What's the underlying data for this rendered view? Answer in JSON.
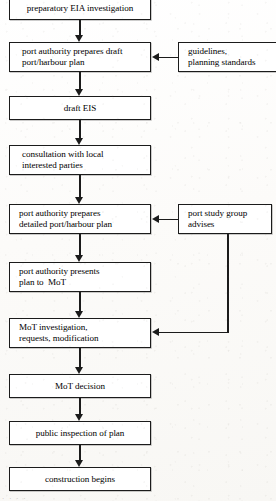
{
  "diagram": {
    "type": "flowchart",
    "line_color": "#1b1b1b",
    "box_fill": "#ffffff",
    "background": "#fdfdfc",
    "bottom_caption": "· · · ·"
  },
  "main_flow": [
    {
      "id": "preparatory-eia-investigation",
      "lines": [
        "preparatory EIA investigation"
      ],
      "align": "center"
    },
    {
      "id": "port-authority-prepares-draft-plan",
      "lines": [
        "port authority prepares draft",
        "port/harbour plan"
      ],
      "align": "left"
    },
    {
      "id": "draft-eis",
      "lines": [
        "draft EIS"
      ],
      "align": "center"
    },
    {
      "id": "consultation-with-local-interested-parties",
      "lines": [
        "consultation with local",
        "interested parties"
      ],
      "align": "left"
    },
    {
      "id": "port-authority-prepares-detailed-plan",
      "lines": [
        "port authority prepares",
        "detailed port/harbour plan"
      ],
      "align": "left"
    },
    {
      "id": "port-authority-presents-plan-to-mot",
      "lines": [
        "port authority presents",
        "plan to  MoT"
      ],
      "align": "left"
    },
    {
      "id": "mot-investigation-requests-modification",
      "lines": [
        "MoT investigation,",
        "requests, modification"
      ],
      "align": "left"
    },
    {
      "id": "mot-decision",
      "lines": [
        "MoT decision"
      ],
      "align": "center"
    },
    {
      "id": "public-inspection-of-plan",
      "lines": [
        "public inspection of plan"
      ],
      "align": "center"
    },
    {
      "id": "construction-begins",
      "lines": [
        "construction begins"
      ],
      "align": "center"
    }
  ],
  "side_inputs": [
    {
      "id": "guidelines-planning-standards",
      "lines": [
        "guidelines,",
        "planning standards"
      ],
      "target": "port-authority-prepares-draft-plan"
    },
    {
      "id": "port-study-group-advises",
      "lines": [
        "port study group",
        "advises"
      ],
      "targets": [
        "port-authority-prepares-detailed-plan",
        "mot-investigation-requests-modification"
      ]
    }
  ]
}
